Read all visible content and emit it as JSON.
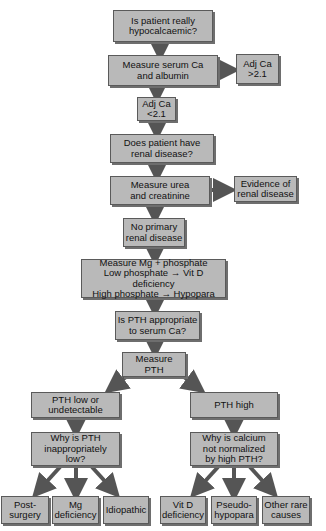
{
  "diagram": {
    "type": "flowchart",
    "colors": {
      "box_fill": "#b9b9b9",
      "box_border": "#5a5a5a",
      "arrow": "#555555",
      "background": "#ffffff"
    },
    "nodes": {
      "q_hypocalcaemic": "Is patient really\nhypocalcaemic?",
      "measure_ca_albumin": "Measure serum Ca\nand albumin",
      "adj_ca_high": "Adj Ca\n>2.1",
      "adj_ca_low": "Adj Ca\n<2.1",
      "q_renal": "Does patient have\nrenal disease?",
      "measure_urea": "Measure urea\nand creatinine",
      "renal_evidence": "Evidence of\nrenal disease",
      "no_renal": "No primary\nrenal disease",
      "measure_mg": "Measure Mg + phosphate\nLow phosphate → Vit D deficiency\nHigh phosphate  → Hypopara",
      "q_pth_appropriate": "Is PTH appropriate\nto serum Ca?",
      "measure_pth": "Measure\nPTH",
      "pth_low": "PTH low or\nundetectable",
      "pth_high": "PTH high",
      "q_pth_low_why": "Why is PTH\ninappropriately\nlow?",
      "q_ca_not_normalized": "Why is calcium\nnot normalized\nby high PTH?",
      "post_surgery": "Post-\nsurgery",
      "mg_deficiency": "Mg\ndeficiency",
      "idiopathic": "Idiopathic",
      "vit_d_deficiency": "Vit D\ndeficiency",
      "pseudo_hypopara": "Pseudo-\nhypopara",
      "other_rare": "Other rare\ncauses"
    },
    "edges": [
      [
        "q_hypocalcaemic",
        "measure_ca_albumin"
      ],
      [
        "measure_ca_albumin",
        "adj_ca_high"
      ],
      [
        "measure_ca_albumin",
        "adj_ca_low"
      ],
      [
        "adj_ca_low",
        "q_renal"
      ],
      [
        "q_renal",
        "measure_urea"
      ],
      [
        "measure_urea",
        "renal_evidence"
      ],
      [
        "measure_urea",
        "no_renal"
      ],
      [
        "no_renal",
        "measure_mg"
      ],
      [
        "measure_mg",
        "q_pth_appropriate"
      ],
      [
        "q_pth_appropriate",
        "measure_pth"
      ],
      [
        "measure_pth",
        "pth_low"
      ],
      [
        "measure_pth",
        "pth_high"
      ],
      [
        "pth_low",
        "q_pth_low_why"
      ],
      [
        "pth_high",
        "q_ca_not_normalized"
      ],
      [
        "q_pth_low_why",
        "post_surgery"
      ],
      [
        "q_pth_low_why",
        "mg_deficiency"
      ],
      [
        "q_pth_low_why",
        "idiopathic"
      ],
      [
        "q_ca_not_normalized",
        "vit_d_deficiency"
      ],
      [
        "q_ca_not_normalized",
        "pseudo_hypopara"
      ],
      [
        "q_ca_not_normalized",
        "other_rare"
      ]
    ]
  }
}
